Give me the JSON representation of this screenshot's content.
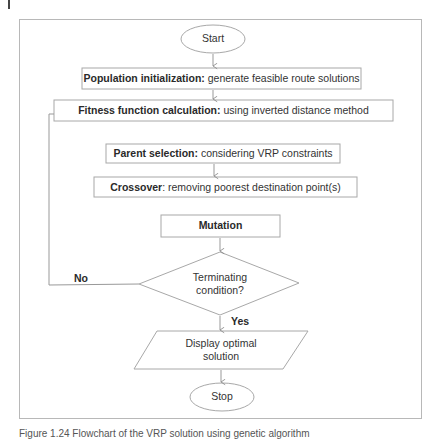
{
  "flowchart": {
    "start": {
      "label": "Start"
    },
    "population": {
      "title": "Population initialization:",
      "desc": " generate feasible route solutions"
    },
    "fitness": {
      "title": "Fitness function calculation:",
      "desc": " using inverted distance method"
    },
    "parent": {
      "title": "Parent selection:",
      "desc": " considering VRP constraints"
    },
    "crossover": {
      "title": "Crossover",
      "desc": ": removing poorest destination point(s)"
    },
    "mutation": {
      "title": "Mutation"
    },
    "decision": {
      "line1": "Terminating",
      "line2": "condition?"
    },
    "no_label": "No",
    "yes_label": "Yes",
    "output": {
      "line1": "Display optimal",
      "line2": "solution"
    },
    "stop": {
      "label": "Stop"
    }
  },
  "caption": "Figure 1.24 Flowchart of the VRP solution using genetic algorithm"
}
